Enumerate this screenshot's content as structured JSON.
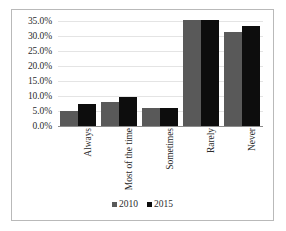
{
  "chart_data": {
    "type": "bar",
    "title": "",
    "subtitle": "",
    "xlabel": "",
    "ylabel": "",
    "categories": [
      "Always",
      "Most of the time",
      "Sometimes",
      "Rarely",
      "Never"
    ],
    "series": [
      {
        "name": "2010",
        "color": "#595959",
        "values": [
          5.0,
          8.1,
          6.0,
          35.2,
          31.4
        ]
      },
      {
        "name": "2015",
        "color": "#0d0d0d",
        "values": [
          7.4,
          9.8,
          6.1,
          35.3,
          33.3
        ]
      }
    ],
    "ylim": [
      0,
      35
    ],
    "ytick_values": [
      0,
      5,
      10,
      15,
      20,
      25,
      30,
      35
    ],
    "ytick_labels": [
      "0.0%",
      "5.0%",
      "10.0%",
      "15.0%",
      "20.0%",
      "25.0%",
      "30.0%",
      "35.0%"
    ],
    "grid": true,
    "grid_axis": "y",
    "legend_position": "bottom",
    "value_suffix": "%",
    "xtick_rotation": -90,
    "annotations": []
  },
  "colors": {
    "series_2010": "#595959",
    "series_2015": "#0d0d0d",
    "gridline": "#e4e4e4",
    "axis": "#8c8c8c",
    "frame_border": "#b9b9b9",
    "text": "#2b2b2b",
    "background": "#ffffff"
  }
}
